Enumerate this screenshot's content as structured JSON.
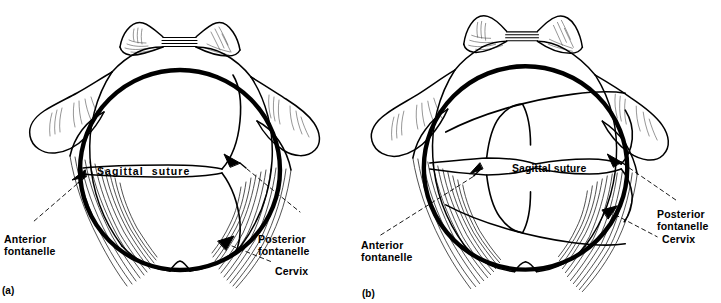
{
  "figure": {
    "background_color": "#ffffff",
    "ink_color": "#000000",
    "width": 721,
    "height": 303
  },
  "panels": [
    {
      "id": "a",
      "caption": "(a)",
      "labels": {
        "sagittal_suture": "Sagittal  suture",
        "anterior_fontanelle": "Anterior\nfontanelle",
        "posterior_fontanelle": "Posterior\nfontanelle",
        "cervix": "Cervix"
      },
      "structures": [
        "symphysis-pubis",
        "pubic-rami",
        "ischial-spine-left",
        "ischial-spine-right",
        "vaginal-wall-striations",
        "cervical-rim",
        "fetal-head",
        "sagittal-suture-line",
        "lambdoid-suture",
        "coccyx-notch"
      ]
    },
    {
      "id": "b",
      "caption": "(b)",
      "labels": {
        "sagittal_suture": "Sagittal suture",
        "anterior_fontanelle": "Anterior\nfontanelle",
        "posterior_fontanelle": "Posterior\nfontanelle",
        "cervix": "Cervix"
      },
      "structures": [
        "symphysis-pubis",
        "pubic-rami",
        "ischial-spine-left",
        "ischial-spine-right",
        "vaginal-wall-striations",
        "cervical-rim",
        "fetal-head",
        "sagittal-suture-line",
        "coronal-suture",
        "lambdoid-suture",
        "parietal-chord-upper",
        "parietal-chord-lower",
        "coccyx-notch"
      ]
    }
  ]
}
